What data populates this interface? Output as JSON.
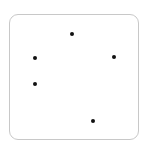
{
  "frame": {
    "border_color": "#c8c8c8",
    "background": "#ffffff"
  },
  "dots": [
    {
      "x": 72,
      "y": 34,
      "color": "#111111"
    },
    {
      "x": 35,
      "y": 58,
      "color": "#111111"
    },
    {
      "x": 114,
      "y": 57,
      "color": "#111111"
    },
    {
      "x": 35,
      "y": 84,
      "color": "#111111"
    },
    {
      "x": 93,
      "y": 121,
      "color": "#111111"
    }
  ]
}
